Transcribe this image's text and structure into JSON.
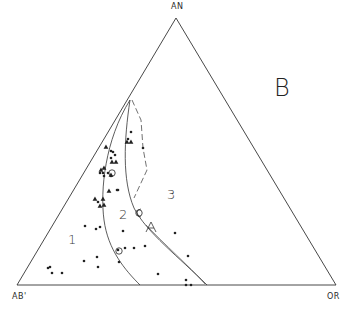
{
  "diagram": {
    "type": "ternary",
    "panel_label": "B",
    "vertices": {
      "top": "AN",
      "bottom_left": "AB'",
      "bottom_right": "OR"
    },
    "field_labels": [
      "1",
      "2",
      "3"
    ],
    "colors": {
      "ink": "#2a2a2a",
      "background": "#ffffff"
    }
  },
  "chart_data": {
    "type": "scatter",
    "title": "",
    "panel": "B",
    "axes": {
      "apex": "AN",
      "left": "AB'",
      "right": "OR"
    },
    "fields": [
      {
        "label": "1",
        "x": 72,
        "y": 242
      },
      {
        "label": "2",
        "x": 124,
        "y": 218
      },
      {
        "label": "3",
        "x": 172,
        "y": 198
      }
    ],
    "series": [
      {
        "name": "dots",
        "marker": "circle",
        "points": [
          [
            131,
            132
          ],
          [
            128,
            139
          ],
          [
            143,
            148
          ],
          [
            111,
            151
          ],
          [
            113,
            152
          ],
          [
            115,
            155
          ],
          [
            111,
            158
          ],
          [
            108,
            173
          ],
          [
            100,
            173
          ],
          [
            103,
            173
          ],
          [
            104,
            176
          ],
          [
            111,
            176
          ],
          [
            118,
            190
          ],
          [
            117,
            190
          ],
          [
            98,
            202
          ],
          [
            96,
            229
          ],
          [
            100,
            227
          ],
          [
            85,
            226
          ],
          [
            97,
            257
          ],
          [
            84,
            261
          ],
          [
            98,
            267
          ],
          [
            123,
            231
          ],
          [
            125,
            248
          ],
          [
            134,
            248
          ],
          [
            145,
            246
          ],
          [
            175,
            233
          ],
          [
            188,
            256
          ],
          [
            158,
            274
          ],
          [
            186,
            280
          ],
          [
            186,
            285
          ],
          [
            191,
            285
          ],
          [
            48,
            268
          ],
          [
            50,
            267
          ],
          [
            52,
            273
          ],
          [
            62,
            273
          ],
          [
            119,
            262
          ],
          [
            118,
            250
          ]
        ]
      },
      {
        "name": "triangles",
        "marker": "triangle",
        "points": [
          [
            106,
            147
          ],
          [
            112,
            162
          ],
          [
            116,
            162
          ],
          [
            101,
            170
          ],
          [
            104,
            168
          ],
          [
            111,
            175
          ],
          [
            109,
            191
          ],
          [
            95,
            199
          ],
          [
            103,
            199
          ],
          [
            104,
            205
          ],
          [
            100,
            206
          ],
          [
            127,
            142
          ],
          [
            131,
            142
          ]
        ]
      },
      {
        "name": "open circles",
        "marker": "open-circle",
        "points": [
          [
            112,
            173
          ],
          [
            119,
            251
          ],
          [
            139,
            213
          ]
        ]
      }
    ],
    "boundaries": [
      {
        "name": "field 1-2 boundary",
        "style": "solid",
        "from": [
          130,
          100
        ],
        "to": [
          140,
          285
        ]
      },
      {
        "name": "field 2-3 boundary",
        "style": "solid",
        "from": [
          130,
          100
        ],
        "to": [
          207,
          285
        ]
      },
      {
        "name": "dashed trend",
        "style": "dashed",
        "from": [
          132,
          100
        ],
        "to": [
          134,
          200
        ]
      }
    ]
  }
}
